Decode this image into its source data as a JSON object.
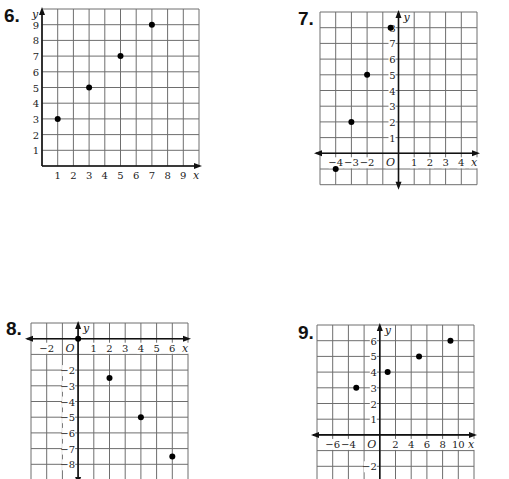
{
  "page": {
    "width": 509,
    "height": 479,
    "background": "#ffffff"
  },
  "chart_data": [
    {
      "id": "graph-6",
      "type": "scatter",
      "label": "6.",
      "xlabel": "x",
      "ylabel": "y",
      "origin_label": "",
      "xlim": [
        0,
        10
      ],
      "ylim": [
        0,
        10
      ],
      "grid": true,
      "x_ticks": [
        1,
        2,
        3,
        4,
        5,
        6,
        7,
        8,
        9
      ],
      "y_ticks": [
        1,
        2,
        3,
        4,
        5,
        6,
        7,
        8,
        9
      ],
      "x": [
        1,
        3,
        5,
        7
      ],
      "y": [
        3,
        5,
        7,
        9
      ],
      "points": [
        [
          1,
          3
        ],
        [
          3,
          5
        ],
        [
          5,
          7
        ],
        [
          7,
          9
        ]
      ],
      "layout": {
        "left": 42,
        "top": 9,
        "cell": 15.7,
        "cols": 10,
        "rows": 10,
        "x_unit": 1,
        "y_unit": 1,
        "x_min": 0,
        "y_max": 10,
        "x_axis_arrows": "right",
        "y_axis_arrows": "up",
        "label_pos": [
          10,
          6
        ]
      }
    },
    {
      "id": "graph-7",
      "type": "scatter",
      "label": "7.",
      "xlabel": "x",
      "ylabel": "y",
      "origin_label": "O",
      "xlim": [
        -5,
        5
      ],
      "ylim": [
        -2,
        9
      ],
      "grid": true,
      "x_ticks": [
        -4,
        -3,
        -2,
        1,
        2,
        3,
        4
      ],
      "y_ticks": [
        1,
        2,
        3,
        4,
        5,
        6,
        7,
        8
      ],
      "x": [
        -4,
        -3,
        -2,
        -0.5
      ],
      "y": [
        -1,
        2,
        5,
        8
      ],
      "points": [
        [
          -4,
          -1
        ],
        [
          -3,
          2
        ],
        [
          -2,
          5
        ],
        [
          -0.5,
          8
        ]
      ],
      "layout": {
        "left": 320,
        "top": 12,
        "cell": 15.7,
        "cols": 10,
        "rows": 11,
        "x_unit": 1,
        "y_unit": 1,
        "x_min": -5,
        "y_max": 9,
        "x_axis_arrows": "both",
        "y_axis_arrows": "both",
        "label_pos": [
          300,
          9
        ]
      }
    },
    {
      "id": "graph-8",
      "type": "scatter",
      "label": "8.",
      "xlabel": "x",
      "ylabel": "y",
      "origin_label": "O",
      "xlim": [
        -3,
        7
      ],
      "ylim": [
        -9,
        1
      ],
      "grid": true,
      "x_ticks": [
        -2,
        1,
        2,
        3,
        4,
        5,
        6
      ],
      "y_ticks": [
        -2,
        -3,
        -4,
        -5,
        -6,
        -7,
        -8
      ],
      "x": [
        0,
        2,
        4,
        6
      ],
      "y": [
        0,
        -2.5,
        -5,
        -7.5
      ],
      "points": [
        [
          0,
          0
        ],
        [
          2,
          -2.5
        ],
        [
          4,
          -5
        ],
        [
          6,
          -7.5
        ]
      ],
      "layout": {
        "left": 31,
        "top": 323,
        "cell": 15.7,
        "cols": 10,
        "rows": 10,
        "x_unit": 1,
        "y_unit": 1,
        "x_min": -3,
        "y_max": 1,
        "x_axis_arrows": "both",
        "y_axis_arrows": "both",
        "label_pos": [
          8,
          320
        ]
      }
    },
    {
      "id": "graph-9",
      "type": "scatter",
      "label": "9.",
      "xlabel": "x",
      "ylabel": "y",
      "origin_label": "O",
      "xlim": [
        -8,
        12
      ],
      "ylim": [
        -3,
        7
      ],
      "grid": true,
      "x_ticks": [
        -6,
        -4,
        2,
        4,
        6,
        8,
        10
      ],
      "y_ticks": [
        1,
        2,
        3,
        4,
        5,
        6,
        -2
      ],
      "x": [
        -3,
        1,
        5,
        9
      ],
      "y": [
        3,
        4,
        5,
        6
      ],
      "points": [
        [
          -3,
          3
        ],
        [
          1,
          4
        ],
        [
          5,
          5
        ],
        [
          9,
          6
        ]
      ],
      "layout": {
        "left": 317,
        "top": 325,
        "cell": 15.7,
        "cols": 10,
        "rows": 10,
        "x_unit": 2,
        "y_unit": 1,
        "x_min": -8,
        "y_max": 7,
        "x_axis_arrows": "both",
        "y_axis_arrows": "both",
        "label_pos": [
          299,
          324
        ]
      }
    }
  ]
}
